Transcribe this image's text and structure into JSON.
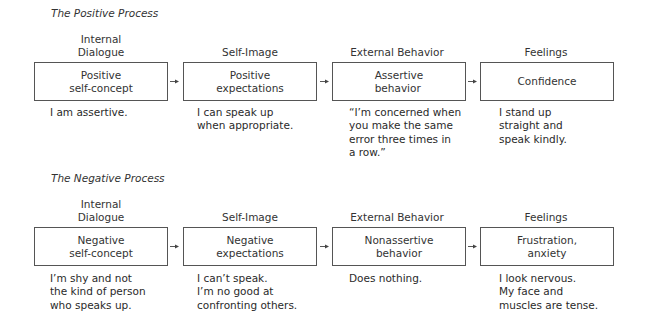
{
  "positive": {
    "title": "The Positive Process",
    "columns": [
      {
        "header": "Internal\nDialogue",
        "box": "Positive\nself-concept",
        "desc": "I am assertive."
      },
      {
        "header": "Self-Image",
        "box": "Positive\nexpectations",
        "desc": "I can speak up\nwhen appropriate."
      },
      {
        "header": "External Behavior",
        "box": "Assertive\nbehavior",
        "desc": "“I’m concerned  when\nyou make the same\nerror  three times in\na row.”"
      },
      {
        "header": "Feelings",
        "box": "Confidence",
        "desc": "I stand up\nstraight and\nspeak kindly."
      }
    ]
  },
  "negative": {
    "title": "The Negative Process",
    "columns": [
      {
        "header": "Internal\nDialogue",
        "box": "Negative\nself-concept",
        "desc": "I’m shy and not\nthe kind of person\nwho speaks up."
      },
      {
        "header": "Self-Image",
        "box": "Negative\nexpectations",
        "desc": "I can’t speak.\nI’m no good at\nconfronting others."
      },
      {
        "header": "External Behavior",
        "box": "Nonassertive\nbehavior",
        "desc": "Does nothing."
      },
      {
        "header": "Feelings",
        "box": "Frustration,\nanxiety",
        "desc": "I look nervous.\nMy face and\nmuscles are tense."
      }
    ]
  },
  "icons": {
    "arrow": "arrow-right-icon"
  }
}
